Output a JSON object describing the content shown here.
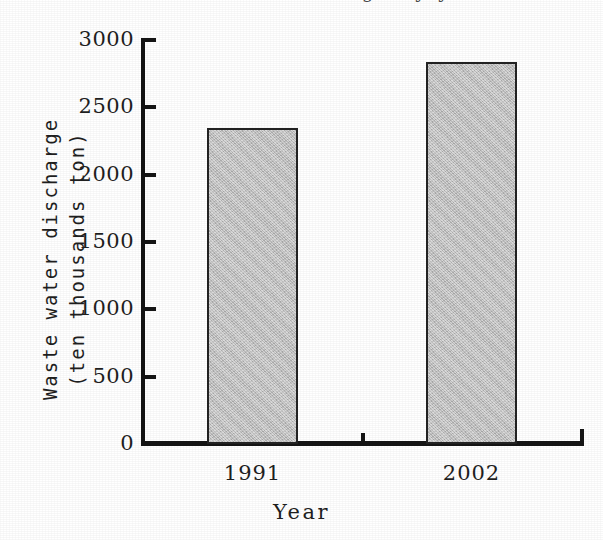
{
  "chart_data": {
    "type": "bar",
    "title": "",
    "cropped_top_title_fragment": "figure title cropped at top edge",
    "categories": [
      "1991",
      "2002"
    ],
    "values": [
      2350,
      2840
    ],
    "series": [
      {
        "name": "Waste water discharge",
        "values": [
          2350,
          2840
        ]
      }
    ],
    "xlabel": "Year",
    "ylabel_line1": "Waste water discharge",
    "ylabel_line2": "(ten thousands ton)",
    "ylabel": "Waste water discharge (ten thousands ton)",
    "ylim": [
      0,
      3000
    ],
    "ytick_labels": [
      "3000",
      "2500",
      "2000",
      "1500",
      "1000",
      "500",
      "0"
    ],
    "ytick_values": [
      3000,
      2500,
      2000,
      1500,
      1000,
      500,
      0
    ],
    "ytick_interval": 500,
    "grid": false,
    "legend": false,
    "colors": {
      "bar_fill": "#bfbfbf",
      "bar_edge": "#232323",
      "axis": "#151515",
      "text": "#1f1f1f",
      "background": "#ffffff"
    }
  }
}
